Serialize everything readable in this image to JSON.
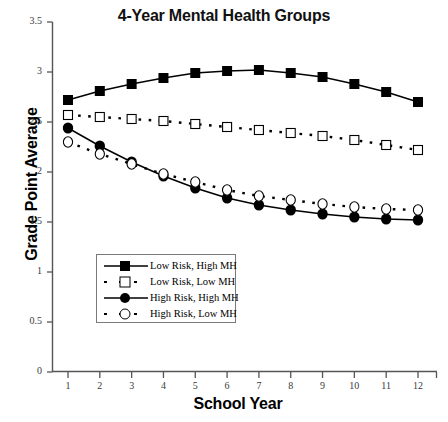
{
  "chart_data": {
    "type": "line",
    "title": "4-Year Mental Health Groups",
    "xlabel": "School Year",
    "ylabel": "Grade Point Average",
    "x": [
      1,
      2,
      3,
      4,
      5,
      6,
      7,
      8,
      9,
      10,
      11,
      12
    ],
    "xticklabels": [
      "1",
      "2",
      "3",
      "4",
      "5",
      "6",
      "7",
      "8",
      "9",
      "10",
      "11",
      "12"
    ],
    "yticklabels": [
      "0",
      "0.5",
      "1",
      "1.5",
      "2",
      "2.5",
      "3",
      "3.5"
    ],
    "yticks": [
      0,
      0.5,
      1,
      1.5,
      2,
      2.5,
      3,
      3.5
    ],
    "xlim": [
      0.5,
      12.5
    ],
    "ylim": [
      0,
      3.5
    ],
    "grid": false,
    "legend_position": "lower-left-inside",
    "series": [
      {
        "name": "Low Risk, High MH",
        "marker": "filled-square",
        "linestyle": "solid",
        "color": "#000000",
        "values": [
          2.72,
          2.81,
          2.88,
          2.94,
          2.99,
          3.01,
          3.02,
          2.99,
          2.95,
          2.88,
          2.8,
          2.7
        ]
      },
      {
        "name": "Low Risk, Low MH",
        "marker": "open-square",
        "linestyle": "dashed",
        "color": "#000000",
        "values": [
          2.57,
          2.55,
          2.53,
          2.51,
          2.48,
          2.45,
          2.42,
          2.39,
          2.36,
          2.32,
          2.27,
          2.22
        ]
      },
      {
        "name": "High Risk, High MH",
        "marker": "filled-circle",
        "linestyle": "solid",
        "color": "#000000",
        "values": [
          2.44,
          2.26,
          2.1,
          1.96,
          1.84,
          1.74,
          1.67,
          1.62,
          1.58,
          1.55,
          1.53,
          1.52
        ]
      },
      {
        "name": "High Risk, Low MH",
        "marker": "open-circle",
        "linestyle": "dashed",
        "color": "#000000",
        "values": [
          2.3,
          2.18,
          2.08,
          1.98,
          1.9,
          1.82,
          1.76,
          1.72,
          1.68,
          1.65,
          1.63,
          1.62
        ]
      }
    ]
  },
  "legend": {
    "items": [
      {
        "label": "Low Risk, High MH"
      },
      {
        "label": "Low Risk, Low MH"
      },
      {
        "label": "High Risk, High MH"
      },
      {
        "label": "High Risk, Low MH"
      }
    ]
  }
}
